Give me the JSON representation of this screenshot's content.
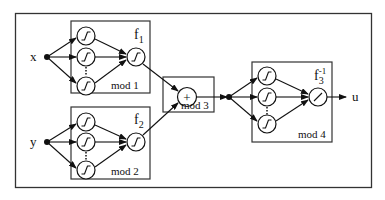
{
  "diagram": {
    "inputs": [
      {
        "id": "x",
        "label": "x"
      },
      {
        "id": "y",
        "label": "y"
      }
    ],
    "output": {
      "id": "u",
      "label": "u"
    },
    "modules": [
      {
        "id": "mod1",
        "label": "mod 1",
        "function": "f",
        "subscript": "1",
        "superscript": "",
        "hidden_activation": "sigmoid",
        "output_activation": "sigmoid"
      },
      {
        "id": "mod2",
        "label": "mod 2",
        "function": "f",
        "subscript": "2",
        "superscript": "",
        "hidden_activation": "sigmoid",
        "output_activation": "sigmoid"
      },
      {
        "id": "mod3",
        "label": "mod 3",
        "operator": "+"
      },
      {
        "id": "mod4",
        "label": "mod 4",
        "function": "f",
        "subscript": "3",
        "superscript": "-1",
        "hidden_activation": "sigmoid",
        "output_activation": "linear"
      }
    ],
    "edges": [
      [
        "x",
        "mod1"
      ],
      [
        "y",
        "mod2"
      ],
      [
        "mod1",
        "mod3"
      ],
      [
        "mod2",
        "mod3"
      ],
      [
        "mod3",
        "mod4"
      ],
      [
        "mod4",
        "u"
      ]
    ],
    "colors": {
      "stroke": "#111111",
      "background": "#ffffff"
    }
  }
}
